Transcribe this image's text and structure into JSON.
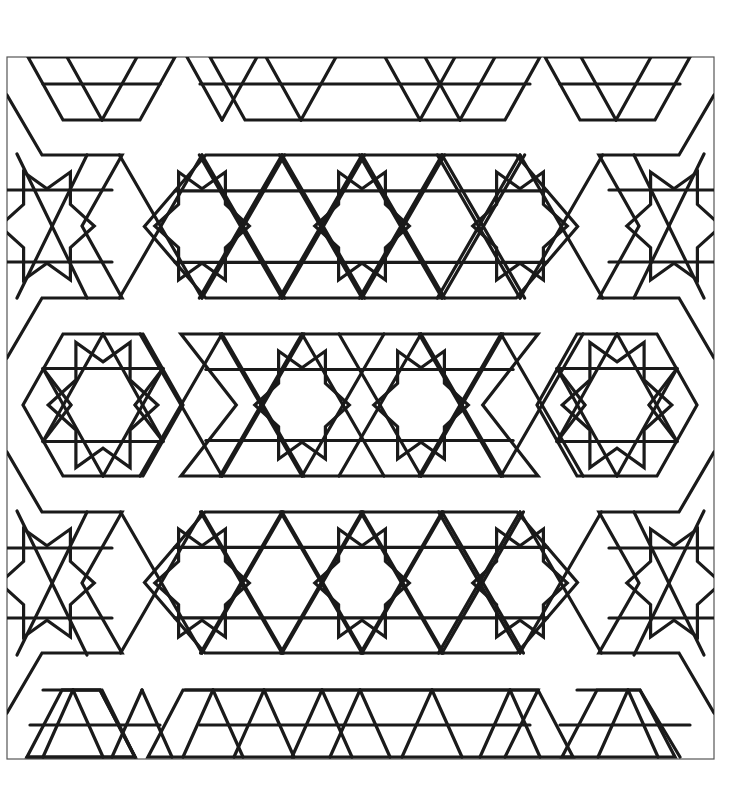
{
  "page": {
    "type": "coloring-page",
    "background": "#ffffff",
    "line_color": "#1a1a1a",
    "frame": {
      "x": 7,
      "y": 57,
      "w": 707,
      "h": 702,
      "color": "#555555"
    }
  },
  "rosettes": [
    {
      "name": "rosette-left",
      "cx": 103,
      "cy": 405,
      "r": 80
    },
    {
      "name": "rosette-right",
      "cx": 617,
      "cy": 405,
      "r": 80
    }
  ],
  "band_stars": [
    {
      "band": "upper",
      "cx": 202,
      "cy": 226
    },
    {
      "band": "upper",
      "cx": 362,
      "cy": 226
    },
    {
      "band": "upper",
      "cx": 520,
      "cy": 226
    },
    {
      "band": "middle",
      "cx": 302,
      "cy": 405
    },
    {
      "band": "middle",
      "cx": 421,
      "cy": 405
    },
    {
      "band": "lower",
      "cx": 202,
      "cy": 583
    },
    {
      "band": "lower",
      "cx": 362,
      "cy": 583
    },
    {
      "band": "lower",
      "cx": 520,
      "cy": 583
    }
  ],
  "star_of_david": [
    {
      "cx": 282,
      "cy": 226
    },
    {
      "cx": 442,
      "cy": 226
    },
    {
      "cx": 282,
      "cy": 583
    },
    {
      "cx": 442,
      "cy": 583
    }
  ]
}
